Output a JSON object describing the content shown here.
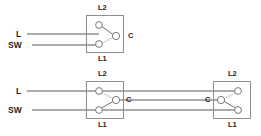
{
  "diagram": {
    "type": "electrical-schematic",
    "canvas": {
      "width": 261,
      "height": 136
    },
    "colors": {
      "background": "#ffffff",
      "wire": "#585858",
      "box_outline": "#8e8e8e",
      "terminal_stroke": "#7a7a7a",
      "terminal_fill": "#ffffff",
      "blade": "#6e6e6e",
      "blade_dashed": "#9a9a9a",
      "text": "#1e1e1e"
    },
    "sections": [
      {
        "id": "top-single-switch",
        "name": "one-way-switch",
        "switches": [
          {
            "id": "top-switch",
            "name": "switch-box-top",
            "label_top": "L2",
            "label_bottom": "L1",
            "label_common": "C",
            "common_side": "right",
            "box": {
              "x": 86,
              "y": 15,
              "w": 38,
              "h": 38
            },
            "terminals": [
              {
                "name": "terminal-l2",
                "label": "L2",
                "cx": 99,
                "cy": 25,
                "r": 3.4
              },
              {
                "name": "terminal-l1",
                "label": "L1",
                "cx": 99,
                "cy": 44,
                "r": 3.4
              },
              {
                "name": "terminal-common",
                "label": "C",
                "cx": 116,
                "cy": 36,
                "r": 3.4
              }
            ],
            "blades": [
              {
                "name": "blade-to-l2",
                "style": "solid",
                "from": "terminal-common",
                "to": "terminal-l2"
              },
              {
                "name": "blade-to-l1",
                "style": "dashed",
                "from": "terminal-common",
                "to": "terminal-l1"
              }
            ]
          }
        ],
        "incoming_wires": [
          {
            "name": "wire-live",
            "label": "L",
            "label_x": 16,
            "label_y": 31,
            "y": 34,
            "x_from": 27,
            "x_to": 99
          },
          {
            "name": "wire-switched-live",
            "label": "SW",
            "label_x": 9,
            "label_y": 42,
            "y": 45,
            "x_from": 32,
            "x_to": 99
          }
        ]
      },
      {
        "id": "bottom-two-way",
        "name": "two-way-switch-pair",
        "switches": [
          {
            "id": "bottom-left-switch",
            "name": "switch-box-bottom-left",
            "label_top": "L2",
            "label_bottom": "L1",
            "label_common": "C",
            "common_side": "right",
            "box": {
              "x": 86,
              "y": 81,
              "w": 38,
              "h": 38
            },
            "terminals": [
              {
                "name": "terminal-l2",
                "label": "L2",
                "cx": 99,
                "cy": 91,
                "r": 3.4
              },
              {
                "name": "terminal-l1",
                "label": "L1",
                "cx": 99,
                "cy": 110,
                "r": 3.4
              },
              {
                "name": "terminal-common",
                "label": "C",
                "cx": 116,
                "cy": 100,
                "r": 3.4
              }
            ],
            "blades": [
              {
                "name": "blade-to-l2",
                "style": "dashed",
                "from": "terminal-common",
                "to": "terminal-l2"
              },
              {
                "name": "blade-to-l1",
                "style": "solid",
                "from": "terminal-common",
                "to": "terminal-l1"
              }
            ]
          },
          {
            "id": "bottom-right-switch",
            "name": "switch-box-bottom-right",
            "label_top": "L2",
            "label_bottom": "L1",
            "label_common": "C",
            "common_side": "left",
            "box": {
              "x": 213,
              "y": 81,
              "w": 38,
              "h": 38
            },
            "terminals": [
              {
                "name": "terminal-l2",
                "label": "L2",
                "cx": 238,
                "cy": 91,
                "r": 3.4
              },
              {
                "name": "terminal-l1",
                "label": "L1",
                "cx": 238,
                "cy": 110,
                "r": 3.4
              },
              {
                "name": "terminal-common",
                "label": "C",
                "cx": 221,
                "cy": 100,
                "r": 3.4
              }
            ],
            "blades": [
              {
                "name": "blade-to-l2",
                "style": "dashed",
                "from": "terminal-common",
                "to": "terminal-l2"
              },
              {
                "name": "blade-to-l1",
                "style": "solid",
                "from": "terminal-common",
                "to": "terminal-l1"
              }
            ]
          }
        ],
        "incoming_wires": [
          {
            "name": "wire-live",
            "label": "L",
            "label_x": 16,
            "label_y": 88,
            "y": 91,
            "x_from": 27,
            "x_to": 99
          },
          {
            "name": "wire-switched-live",
            "label": "SW",
            "label_x": 9,
            "label_y": 107,
            "y": 110,
            "x_from": 32,
            "x_to": 99
          }
        ],
        "strappers": [
          {
            "name": "strapper-top",
            "y": 91,
            "x_from": 99,
            "x_to": 238
          },
          {
            "name": "strapper-common",
            "y": 100,
            "x_from": 116,
            "x_to": 221
          },
          {
            "name": "strapper-bottom",
            "y": 110,
            "x_from": 99,
            "x_to": 238
          }
        ]
      }
    ],
    "labels": {
      "live": "L",
      "switched_live": "SW",
      "common": "C",
      "terminal_l1": "L1",
      "terminal_l2": "L2"
    }
  }
}
